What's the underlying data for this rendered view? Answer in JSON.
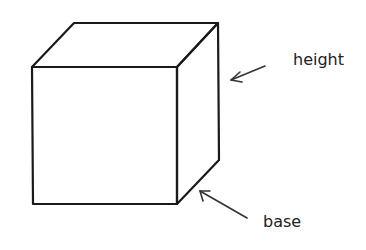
{
  "diagram": {
    "type": "cube",
    "labels": {
      "height": "height",
      "base": "base"
    },
    "colors": {
      "stroke": "#1a1a1a",
      "text": "#222222",
      "background": "#ffffff"
    }
  }
}
